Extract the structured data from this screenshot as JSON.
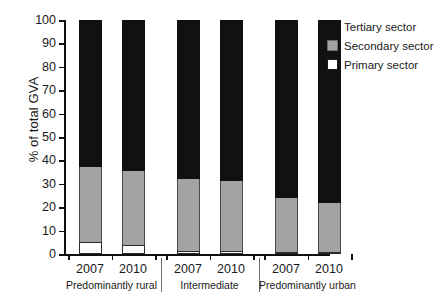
{
  "chart_data": {
    "type": "bar",
    "subtype": "stacked-bar-100",
    "title": "",
    "xlabel": "",
    "ylabel": "% of total GVA",
    "ylim": [
      0,
      100
    ],
    "yticks": [
      0,
      10,
      20,
      30,
      40,
      50,
      60,
      70,
      80,
      90,
      100
    ],
    "grid": false,
    "legend_position": "top-right",
    "categories": [
      "2007",
      "2010",
      "2007",
      "2010",
      "2007",
      "2010"
    ],
    "groups": [
      {
        "label": "Predominantly rural",
        "categories": [
          "2007",
          "2010"
        ]
      },
      {
        "label": "Intermediate",
        "categories": [
          "2007",
          "2010"
        ]
      },
      {
        "label": "Predominantly urban",
        "categories": [
          "2007",
          "2010"
        ]
      }
    ],
    "series": [
      {
        "name": "Primary sector",
        "color": "#ffffff",
        "values": [
          5,
          4,
          1.5,
          1.5,
          0.7,
          0.7
        ]
      },
      {
        "name": "Secondary sector",
        "color": "#a3a3a3",
        "values": [
          32,
          31.5,
          30.5,
          29.5,
          23.3,
          21.3
        ]
      },
      {
        "name": "Tertiary sector",
        "color": "#111111",
        "values": [
          63,
          64.5,
          68,
          69,
          76,
          78
        ]
      }
    ],
    "cumulative_tops": {
      "primary": [
        5,
        4,
        1.5,
        1.5,
        0.7,
        0.7
      ],
      "secondary": [
        37,
        35.5,
        32,
        31,
        24,
        22
      ],
      "tertiary": [
        100,
        100,
        100,
        100,
        100,
        100
      ]
    },
    "annotations": []
  },
  "legend": {
    "items": [
      {
        "label": "Tertiary sector",
        "swatch": "black-swatch"
      },
      {
        "label": "Secondary sector",
        "swatch": "gray-swatch"
      },
      {
        "label": "Primary sector",
        "swatch": "white-swatch"
      }
    ]
  },
  "axis": {
    "y_title": "% of total GVA",
    "y_labels": [
      "100",
      "90",
      "80",
      "70",
      "60",
      "50",
      "40",
      "30",
      "20",
      "10",
      "0"
    ],
    "x_year_labels": [
      "2007",
      "2010",
      "2007",
      "2010",
      "2007",
      "2010"
    ],
    "x_group_labels": [
      "Predominantly rural",
      "Intermediate",
      "Predominantly urban"
    ]
  },
  "colors": {
    "tertiary": "#111111",
    "secondary": "#a3a3a3",
    "primary": "#ffffff",
    "axis": "#101010",
    "text": "#1a1a1a"
  }
}
